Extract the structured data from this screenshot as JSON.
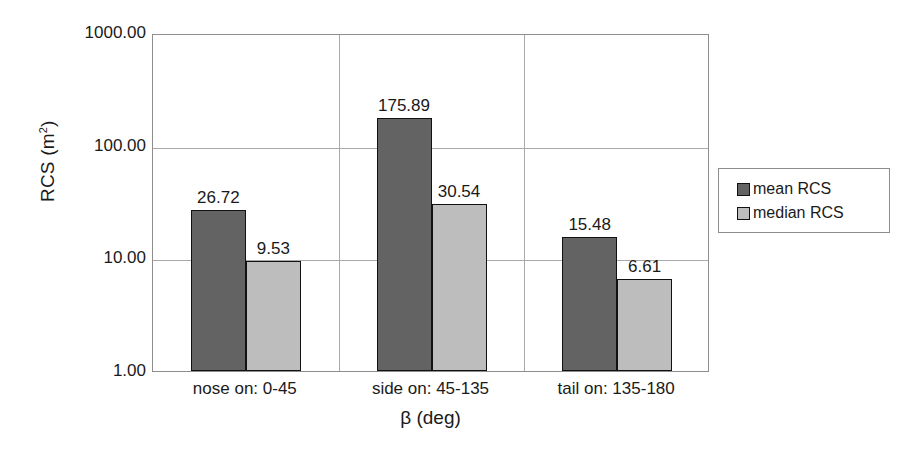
{
  "chart_data": {
    "type": "bar",
    "title": "",
    "subtitle": "",
    "xlabel": "β (deg)",
    "ylabel": "RCS (m²)",
    "ylabel_base": "RCS (m",
    "ylabel_sup": "2",
    "ylabel_close": ")",
    "yscale": "log",
    "ylim": [
      1.0,
      1000.0
    ],
    "ytick_labels": [
      "1000.00",
      "100.00",
      "10.00",
      "1.00"
    ],
    "ytick_values": [
      1000.0,
      100.0,
      10.0,
      1.0
    ],
    "grid": true,
    "legend_position": "right",
    "categories": [
      "nose on:  0-45",
      "side on: 45-135",
      "tail on: 135-180"
    ],
    "series": [
      {
        "name": "mean RCS",
        "color": "#636363",
        "values": [
          26.72,
          175.89,
          15.48
        ],
        "labels": [
          "26.72",
          "175.89",
          "15.48"
        ]
      },
      {
        "name": "median RCS",
        "color": "#bdbdbd",
        "values": [
          9.53,
          30.54,
          6.61
        ],
        "labels": [
          "9.53",
          "30.54",
          "6.61"
        ]
      }
    ]
  },
  "legend": {
    "items": [
      {
        "label": "mean RCS",
        "swatch": "mean"
      },
      {
        "label": "median RCS",
        "swatch": "median"
      }
    ]
  },
  "colors": {
    "mean_bar": "#636363",
    "median_bar": "#bdbdbd",
    "bar_outline": "#111111",
    "gridline": "#a9a9a9",
    "axis_frame": "#8d8d8d",
    "text": "#1a1a1a",
    "background": "#ffffff"
  }
}
